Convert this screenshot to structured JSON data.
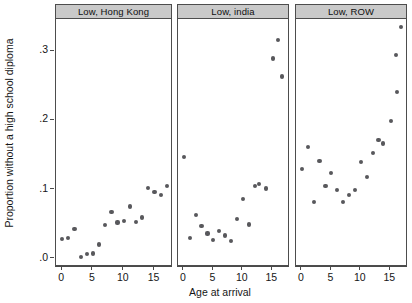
{
  "chart_data": {
    "type": "scatter",
    "title": "",
    "xlabel": "Age at arrival",
    "ylabel": "Proportion without a high school diploma",
    "xlim": [
      -1,
      18
    ],
    "ylim": [
      -0.012,
      0.345
    ],
    "yticks": [
      0,
      0.1,
      0.2,
      0.3
    ],
    "yticklabels": [
      ".0",
      ".1",
      ".2",
      ".3"
    ],
    "xticks": [
      0,
      5,
      10,
      15
    ],
    "xticklabels": [
      "0",
      "5",
      "10",
      "15"
    ],
    "grid": false,
    "legend": null,
    "marker_color": "#58585c",
    "panel_header_color": "#c9c9c9",
    "panels": [
      {
        "label": "Low, Hong Kong",
        "x": [
          0,
          1,
          2,
          3,
          4,
          5,
          6,
          7,
          8,
          9,
          10,
          11,
          12,
          13,
          14,
          15,
          16,
          17
        ],
        "y": [
          0.027,
          0.028,
          0.041,
          0.001,
          0.005,
          0.006,
          0.019,
          0.047,
          0.066,
          0.051,
          0.053,
          0.074,
          0.052,
          0.058,
          0.101,
          0.095,
          0.091,
          0.104
        ]
      },
      {
        "label": "Low, india",
        "x": [
          0,
          1,
          2,
          3,
          4,
          5,
          6,
          7,
          8,
          9,
          10,
          11,
          12,
          13,
          14,
          15,
          16
        ],
        "y": [
          0.145,
          0.029,
          0.062,
          0.046,
          0.035,
          0.026,
          0.039,
          0.032,
          0.024,
          0.056,
          0.085,
          0.048,
          0.104,
          0.107,
          0.1,
          0.288,
          0.315,
          0.262
        ]
      },
      {
        "label": "Low, ROW",
        "x": [
          0,
          1,
          2,
          3,
          4,
          5,
          6,
          7,
          8,
          9,
          10,
          11,
          12,
          13,
          14,
          15,
          16
        ],
        "y": [
          0.128,
          0.16,
          0.081,
          0.104,
          0.14,
          0.122,
          0.098,
          0.08,
          0.091,
          0.098,
          0.138,
          0.117,
          0.151,
          0.17,
          0.165,
          0.197,
          0.239,
          0.293,
          0.333
        ]
      }
    ],
    "series": [
      {
        "name": "Low, Hong Kong",
        "points": [
          [
            0,
            0.027
          ],
          [
            1,
            0.028
          ],
          [
            2,
            0.041
          ],
          [
            3,
            0.001
          ],
          [
            4,
            0.005
          ],
          [
            5,
            0.006
          ],
          [
            6,
            0.019
          ],
          [
            7,
            0.047
          ],
          [
            8,
            0.066
          ],
          [
            9,
            0.051
          ],
          [
            10,
            0.053
          ],
          [
            11,
            0.074
          ],
          [
            12,
            0.052
          ],
          [
            13,
            0.058
          ],
          [
            14,
            0.101
          ],
          [
            15,
            0.095
          ],
          [
            16,
            0.091
          ],
          [
            17,
            0.104
          ]
        ]
      },
      {
        "name": "Low, india",
        "points": [
          [
            0,
            0.145
          ],
          [
            1,
            0.029
          ],
          [
            2,
            0.062
          ],
          [
            3,
            0.046
          ],
          [
            4,
            0.035
          ],
          [
            5,
            0.026
          ],
          [
            6,
            0.039
          ],
          [
            7,
            0.032
          ],
          [
            8,
            0.024
          ],
          [
            9,
            0.056
          ],
          [
            10,
            0.085
          ],
          [
            11,
            0.048
          ],
          [
            12,
            0.104
          ],
          [
            12.8,
            0.107
          ],
          [
            13.9,
            0.1
          ],
          [
            15.1,
            0.288
          ],
          [
            16.0,
            0.315
          ],
          [
            16.6,
            0.262
          ]
        ]
      },
      {
        "name": "Low, ROW",
        "points": [
          [
            0,
            0.128
          ],
          [
            1,
            0.16
          ],
          [
            2,
            0.081
          ],
          [
            3,
            0.14
          ],
          [
            4,
            0.104
          ],
          [
            5,
            0.122
          ],
          [
            6,
            0.098
          ],
          [
            7,
            0.08
          ],
          [
            8,
            0.091
          ],
          [
            9,
            0.098
          ],
          [
            10,
            0.138
          ],
          [
            11,
            0.117
          ],
          [
            12,
            0.151
          ],
          [
            13,
            0.17
          ],
          [
            13.8,
            0.165
          ],
          [
            15.1,
            0.197
          ],
          [
            16.1,
            0.239
          ],
          [
            16.0,
            0.293
          ],
          [
            16.8,
            0.333
          ]
        ]
      }
    ]
  }
}
